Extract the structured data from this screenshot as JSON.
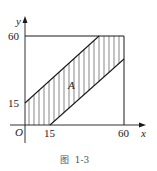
{
  "figure": {
    "caption": "图  1-3",
    "region_label": "A",
    "axes": {
      "x_label": "x",
      "y_label": "y",
      "origin_label": "O",
      "x_ticks": [
        "15",
        "60"
      ],
      "y_ticks": [
        "15",
        "60"
      ]
    },
    "square": {
      "x0": 0,
      "y0": 0,
      "x1": 60,
      "y1": 60
    },
    "lines": [
      {
        "name": "upper-boundary",
        "from": [
          0,
          15
        ],
        "to": [
          45,
          60
        ],
        "equation": "y = x + 15"
      },
      {
        "name": "lower-boundary",
        "from": [
          15,
          0
        ],
        "to": [
          60,
          45
        ],
        "equation": "y = x - 15"
      }
    ],
    "shaded_region": "|x - y| <= 15 within the square [0,60]x[0,60]",
    "colors": {
      "stroke": "#1a1a1a",
      "hatch": "#555555"
    }
  }
}
